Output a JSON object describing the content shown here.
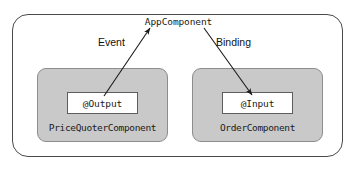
{
  "diagram": {
    "root": {
      "title": "AppComponent"
    },
    "components": [
      {
        "name": "PriceQuoterComponent",
        "decorator": "@Output"
      },
      {
        "name": "OrderComponent",
        "decorator": "@Input"
      }
    ],
    "edges": [
      {
        "label": "Event",
        "from": "@Output",
        "to": "AppComponent",
        "direction": "up-right"
      },
      {
        "label": "Binding",
        "from": "AppComponent",
        "to": "@Input",
        "direction": "down-right"
      }
    ],
    "colors": {
      "outer_border": "#4a4a4a",
      "component_fill": "#c9c9c9",
      "component_border": "#8d8d8d",
      "decorator_fill": "#ffffff",
      "decorator_border": "#5d5d5d",
      "arrow": "#1a1a1a",
      "text": "#1a1a1a",
      "background": "#ffffff"
    }
  }
}
